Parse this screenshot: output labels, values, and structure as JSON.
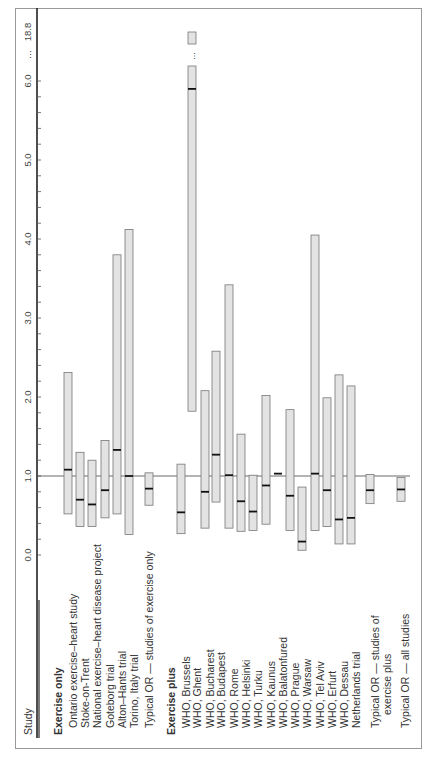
{
  "chart_data": {
    "type": "forest",
    "orientation": "rotated-90-ccw",
    "title": "",
    "xlabel": "Study",
    "ylabel": "Odds ratio",
    "axis": {
      "ticks": [
        "0.0",
        "1.0",
        "2.0",
        "3.0",
        "4.0",
        "5.0",
        "6.0 ... 18.8"
      ],
      "tick_values": [
        0,
        1,
        2,
        3,
        4,
        5,
        6
      ],
      "break": {
        "from": 6.0,
        "to": 18.8,
        "label": "..."
      },
      "reference_line": 1.0,
      "range": [
        0,
        18.8
      ]
    },
    "groups": [
      {
        "name": "Exercise only",
        "studies": [
          {
            "label": "Ontario exercise–heart study",
            "or": 1.08,
            "lo": 0.52,
            "hi": 2.31
          },
          {
            "label": "Stoke-on-Trent",
            "or": 0.7,
            "lo": 0.36,
            "hi": 1.3
          },
          {
            "label": "National exercise–heart disease project",
            "or": 0.64,
            "lo": 0.36,
            "hi": 1.2
          },
          {
            "label": "Goteborg trial",
            "or": 0.82,
            "lo": 0.47,
            "hi": 1.45
          },
          {
            "label": "Alton–Hants trial",
            "or": 1.33,
            "lo": 0.52,
            "hi": 3.8
          },
          {
            "label": "Torino, Italy trial",
            "or": 1.0,
            "lo": 0.26,
            "hi": 4.12
          }
        ],
        "summary": {
          "label": "Typical OR — studies of exercise only",
          "or": 0.84,
          "lo": 0.63,
          "hi": 1.04
        }
      },
      {
        "name": "Exercise plus",
        "studies": [
          {
            "label": "WHO, Brussels",
            "or": 0.54,
            "lo": 0.27,
            "hi": 1.15
          },
          {
            "label": "WHO, Ghent",
            "or": 5.9,
            "lo": 1.82,
            "hi": 18.8
          },
          {
            "label": "WHO, Bucharest",
            "or": 0.8,
            "lo": 0.34,
            "hi": 2.08
          },
          {
            "label": "WHO, Budapest",
            "or": 1.27,
            "lo": 0.67,
            "hi": 2.58
          },
          {
            "label": "WHO, Rome",
            "or": 1.01,
            "lo": 0.34,
            "hi": 3.42
          },
          {
            "label": "WHO, Helsinki",
            "or": 0.68,
            "lo": 0.3,
            "hi": 1.53
          },
          {
            "label": "WHO, Turku",
            "or": 0.55,
            "lo": 0.31,
            "hi": 1.01
          },
          {
            "label": "WHO, Kaunus",
            "or": 0.88,
            "lo": 0.39,
            "hi": 2.02
          },
          {
            "label": "WHO, Balatonfured",
            "or": 1.03,
            "lo": 1.03,
            "hi": 1.03
          },
          {
            "label": "WHO, Prague",
            "or": 0.75,
            "lo": 0.31,
            "hi": 1.84
          },
          {
            "label": "WHO, Warsaw",
            "or": 0.17,
            "lo": 0.06,
            "hi": 0.86
          },
          {
            "label": "WHO, Tel Aviv",
            "or": 1.03,
            "lo": 0.31,
            "hi": 4.05
          },
          {
            "label": "WHO, Erfurt",
            "or": 0.82,
            "lo": 0.36,
            "hi": 1.99
          },
          {
            "label": "WHO, Dessau",
            "or": 0.45,
            "lo": 0.14,
            "hi": 2.28
          },
          {
            "label": "Netherlands trial",
            "or": 0.47,
            "lo": 0.14,
            "hi": 2.14
          }
        ],
        "summary": {
          "label": "Typical OR — studies of exercise plus",
          "or": 0.82,
          "lo": 0.65,
          "hi": 1.02
        }
      }
    ],
    "overall": {
      "label": "Typical OR — all studies",
      "or": 0.83,
      "lo": 0.68,
      "hi": 0.98
    },
    "grid": false,
    "legend": null
  },
  "labels": {
    "study_header": "Study",
    "group_exercise_only": "Exercise only",
    "group_exercise_plus": "Exercise plus",
    "summary_exercise_only": "Typical OR — studies of exercise only",
    "summary_exercise_plus_line1": "Typical OR — studies of",
    "summary_exercise_plus_line2": "exercise plus",
    "summary_all": "Typical OR — all studies",
    "break_dots": "..."
  },
  "colors": {
    "bar_fill": "#e3e3e3",
    "bar_stroke": "#777777",
    "marker": "#111111",
    "axis": "#222222",
    "frame": "#999999"
  }
}
